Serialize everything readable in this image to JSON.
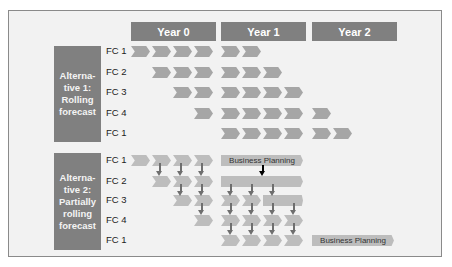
{
  "colors": {
    "frame_bg": "#f2f2f2",
    "header_bg": "#808080",
    "alt1_chevron": "#a6a6a6",
    "alt2_chevron": "#bdbdbd",
    "arrow": "#6e6e6e",
    "planning_arrow": "#000000"
  },
  "years": [
    {
      "label": "Year 0"
    },
    {
      "label": "Year 1"
    },
    {
      "label": "Year 2"
    }
  ],
  "alternatives": [
    {
      "label": "Alterna-tive 1: Rolling forecast",
      "rows": [
        "FC 1",
        "FC 2",
        "FC 3",
        "FC 4",
        "FC 1"
      ]
    },
    {
      "label": "Alterna-tive 2: Partially rolling forecast",
      "rows": [
        "FC 1",
        "FC 2",
        "FC 3",
        "FC 4",
        "FC 1"
      ]
    }
  ],
  "business_planning": {
    "label_year1": "Business Planning",
    "label_year2": "Business Planning"
  }
}
